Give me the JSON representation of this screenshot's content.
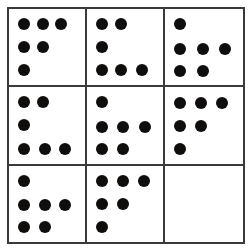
{
  "puzzle": {
    "title": "Dot Matrix Reasoning Puzzle",
    "type": "3x3-matrix",
    "rows": 3,
    "columns": 3,
    "dot_color": "#100d0d",
    "line_color": "#3a3a3a",
    "background_color": "#ffffff",
    "dot_diameter": 12,
    "cells": [
      {
        "id": "cell-1",
        "position": "top-left",
        "row": 0,
        "col": 0,
        "dot_count": 6,
        "row_counts": [
          3,
          2,
          1
        ],
        "pattern": "descending-staircase",
        "empty": false,
        "dots": [
          {
            "x": 15,
            "y": 15
          },
          {
            "x": 34,
            "y": 15
          },
          {
            "x": 52,
            "y": 15
          },
          {
            "x": 15,
            "y": 38
          },
          {
            "x": 34,
            "y": 38
          },
          {
            "x": 15,
            "y": 61
          }
        ]
      },
      {
        "id": "cell-2",
        "position": "top-middle",
        "row": 0,
        "col": 1,
        "dot_count": 6,
        "row_counts": [
          2,
          1,
          3
        ],
        "pattern": "ascending-staircase",
        "empty": false,
        "dots": [
          {
            "x": 15,
            "y": 15
          },
          {
            "x": 34,
            "y": 15
          },
          {
            "x": 15,
            "y": 38
          },
          {
            "x": 15,
            "y": 61
          },
          {
            "x": 34,
            "y": 61
          },
          {
            "x": 55,
            "y": 61
          }
        ]
      },
      {
        "id": "cell-3",
        "position": "top-right",
        "row": 0,
        "col": 2,
        "dot_count": 6,
        "row_counts": [
          1,
          3,
          2
        ],
        "pattern": "arrow-left",
        "empty": false,
        "dots": [
          {
            "x": 15,
            "y": 15
          },
          {
            "x": 15,
            "y": 40
          },
          {
            "x": 38,
            "y": 40
          },
          {
            "x": 60,
            "y": 40
          },
          {
            "x": 15,
            "y": 62
          },
          {
            "x": 38,
            "y": 62
          }
        ]
      },
      {
        "id": "cell-4",
        "position": "middle-left",
        "row": 1,
        "col": 0,
        "dot_count": 6,
        "row_counts": [
          2,
          1,
          3
        ],
        "pattern": "ascending-staircase",
        "empty": false,
        "dots": [
          {
            "x": 15,
            "y": 15
          },
          {
            "x": 34,
            "y": 15
          },
          {
            "x": 15,
            "y": 38
          },
          {
            "x": 15,
            "y": 62
          },
          {
            "x": 36,
            "y": 62
          },
          {
            "x": 56,
            "y": 62
          }
        ]
      },
      {
        "id": "cell-5",
        "position": "center",
        "row": 1,
        "col": 1,
        "dot_count": 6,
        "row_counts": [
          1,
          3,
          2
        ],
        "pattern": "arrow-left",
        "empty": false,
        "dots": [
          {
            "x": 15,
            "y": 15
          },
          {
            "x": 15,
            "y": 40
          },
          {
            "x": 36,
            "y": 40
          },
          {
            "x": 58,
            "y": 40
          },
          {
            "x": 15,
            "y": 62
          },
          {
            "x": 36,
            "y": 62
          }
        ]
      },
      {
        "id": "cell-6",
        "position": "middle-right",
        "row": 1,
        "col": 2,
        "dot_count": 6,
        "row_counts": [
          3,
          2,
          1
        ],
        "pattern": "descending-staircase",
        "empty": false,
        "dots": [
          {
            "x": 15,
            "y": 16
          },
          {
            "x": 36,
            "y": 16
          },
          {
            "x": 57,
            "y": 16
          },
          {
            "x": 15,
            "y": 39
          },
          {
            "x": 36,
            "y": 39
          },
          {
            "x": 15,
            "y": 62
          }
        ]
      },
      {
        "id": "cell-7",
        "position": "bottom-left",
        "row": 2,
        "col": 0,
        "dot_count": 6,
        "row_counts": [
          1,
          3,
          2
        ],
        "pattern": "arrow-left",
        "empty": false,
        "dots": [
          {
            "x": 15,
            "y": 15
          },
          {
            "x": 15,
            "y": 39
          },
          {
            "x": 36,
            "y": 39
          },
          {
            "x": 56,
            "y": 39
          },
          {
            "x": 15,
            "y": 61
          },
          {
            "x": 36,
            "y": 61
          }
        ]
      },
      {
        "id": "cell-8",
        "position": "bottom-middle",
        "row": 2,
        "col": 1,
        "dot_count": 6,
        "row_counts": [
          3,
          2,
          1
        ],
        "pattern": "descending-staircase",
        "empty": false,
        "dots": [
          {
            "x": 15,
            "y": 15
          },
          {
            "x": 36,
            "y": 15
          },
          {
            "x": 57,
            "y": 15
          },
          {
            "x": 15,
            "y": 38
          },
          {
            "x": 36,
            "y": 38
          },
          {
            "x": 15,
            "y": 61
          }
        ]
      },
      {
        "id": "cell-9",
        "position": "bottom-right",
        "row": 2,
        "col": 2,
        "dot_count": 0,
        "row_counts": [
          0,
          0,
          0
        ],
        "pattern": "blank-missing-answer",
        "empty": true,
        "dots": []
      }
    ]
  }
}
